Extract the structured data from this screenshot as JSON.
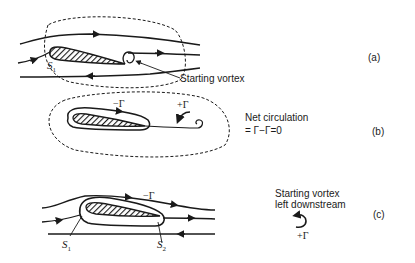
{
  "figure": {
    "panels": [
      {
        "id": "a",
        "label": "(a)",
        "annotations": {
          "stagnation_point": "S",
          "stagnation_sub": "1",
          "starting_vortex": "Starting vortex"
        }
      },
      {
        "id": "b",
        "label": "(b)",
        "annotations": {
          "minus_gamma": "−Γ",
          "plus_gamma": "+Γ",
          "net_circulation_line1": "Net circulation",
          "net_circulation_line2": "= Γ−Γ=0"
        }
      },
      {
        "id": "c",
        "label": "(c)",
        "annotations": {
          "minus_gamma": "−Γ",
          "s1": "S",
          "s1_sub": "1",
          "s2": "S",
          "s2_sub": "2",
          "left_vortex_line1": "Starting vortex",
          "left_vortex_line2": "left downstream",
          "plus_gamma": "+Γ"
        }
      }
    ],
    "colors": {
      "ink": "#1a1a1a",
      "background": "#ffffff"
    }
  }
}
